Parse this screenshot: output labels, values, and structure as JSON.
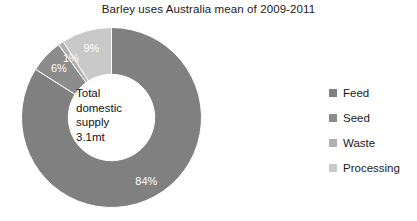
{
  "chart_data": {
    "type": "pie",
    "variant": "donut",
    "title": "Barley uses Australia mean of 2009-2011",
    "xlabel": "",
    "ylabel": "",
    "categories": [
      "Feed",
      "Seed",
      "Waste",
      "Processing"
    ],
    "values": [
      84,
      6,
      1,
      9
    ],
    "value_labels": [
      "84%",
      "6%",
      "1%",
      "9%"
    ],
    "colors": [
      "#808080",
      "#8c8c8c",
      "#b0b0b0",
      "#c9c9c9"
    ],
    "start_angle_deg": 0,
    "direction": "clockwise",
    "inner_radius_ratio": 0.48,
    "legend_position": "right",
    "grid": false,
    "center_label": {
      "line1": "Total",
      "line2": "domestic",
      "line3": "supply",
      "line4": "3.1mt"
    }
  },
  "legend": {
    "items": [
      {
        "label": "Feed",
        "color": "#808080"
      },
      {
        "label": "Seed",
        "color": "#8c8c8c"
      },
      {
        "label": "Waste",
        "color": "#b0b0b0"
      },
      {
        "label": "Processing",
        "color": "#c9c9c9"
      }
    ]
  }
}
